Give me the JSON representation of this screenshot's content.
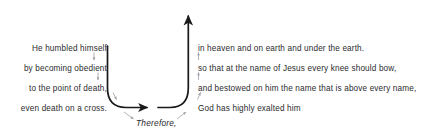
{
  "diagram": {
    "pivot_word": "Therefore,",
    "colors": {
      "text": "#2b2b2e",
      "main_arc": "#1a1a1a",
      "minor_arrow": "#9a9aa2",
      "background": "#ffffff"
    },
    "descent": {
      "label": "descent-branch",
      "lines": [
        {
          "text": "He humbled himself",
          "y": 44
        },
        {
          "text": "by becoming obedient",
          "y": 64
        },
        {
          "text": "to the point of death,",
          "y": 84
        },
        {
          "text": "even death on a cross.",
          "y": 104
        }
      ]
    },
    "ascent": {
      "label": "ascent-branch",
      "lines": [
        {
          "text": "in heaven and on earth and under the earth.",
          "y": 44
        },
        {
          "text": "so that at the name of Jesus every knee should bow,",
          "y": 64
        },
        {
          "text": "and bestowed on him the name that is above every name,",
          "y": 84
        },
        {
          "text": "God has highly exalted him",
          "y": 104
        }
      ]
    }
  }
}
